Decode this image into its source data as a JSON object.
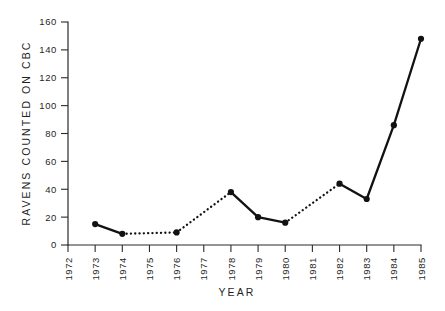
{
  "figure": {
    "background": "#ffffff",
    "ink_color": "#121212"
  },
  "chart_data": {
    "type": "line",
    "title": "",
    "xlabel": "YEAR",
    "ylabel": "RAVENS COUNTED ON CBC",
    "xlim": [
      1972,
      1985
    ],
    "ylim": [
      0,
      160
    ],
    "grid": false,
    "legend": "none",
    "xticks": [
      1972,
      1973,
      1974,
      1975,
      1976,
      1977,
      1978,
      1979,
      1980,
      1981,
      1982,
      1983,
      1984,
      1985
    ],
    "xtick_labels": [
      "1972",
      "1973",
      "1974",
      "1975",
      "1976",
      "1977",
      "1978",
      "1979",
      "1980",
      "1981",
      "1982",
      "1983",
      "1984",
      "1985"
    ],
    "xtick_rotation": 90,
    "yticks": [
      0,
      20,
      40,
      60,
      80,
      100,
      120,
      140,
      160
    ],
    "ytick_labels": [
      "0",
      "20",
      "40",
      "60",
      "80",
      "100",
      "120",
      "140",
      "160"
    ],
    "x": [
      1973,
      1974,
      1976,
      1978,
      1979,
      1980,
      1982,
      1983,
      1984,
      1985
    ],
    "values": [
      15,
      8,
      9,
      38,
      20,
      16,
      44,
      33,
      86,
      148
    ],
    "points": [
      {
        "x": 1973,
        "y": 15
      },
      {
        "x": 1974,
        "y": 8
      },
      {
        "x": 1976,
        "y": 9
      },
      {
        "x": 1978,
        "y": 38
      },
      {
        "x": 1979,
        "y": 20
      },
      {
        "x": 1980,
        "y": 16
      },
      {
        "x": 1982,
        "y": 44
      },
      {
        "x": 1983,
        "y": 33
      },
      {
        "x": 1984,
        "y": 86
      },
      {
        "x": 1985,
        "y": 148
      }
    ],
    "segments": [
      {
        "from": 1973,
        "to": 1974,
        "style": "solid"
      },
      {
        "from": 1974,
        "to": 1976,
        "style": "dotted"
      },
      {
        "from": 1976,
        "to": 1978,
        "style": "dotted"
      },
      {
        "from": 1978,
        "to": 1979,
        "style": "solid"
      },
      {
        "from": 1979,
        "to": 1980,
        "style": "solid"
      },
      {
        "from": 1980,
        "to": 1982,
        "style": "dotted"
      },
      {
        "from": 1982,
        "to": 1983,
        "style": "solid"
      },
      {
        "from": 1983,
        "to": 1984,
        "style": "solid"
      },
      {
        "from": 1984,
        "to": 1985,
        "style": "solid"
      }
    ]
  }
}
